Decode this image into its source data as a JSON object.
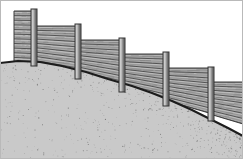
{
  "figure": {
    "width": 243,
    "height": 159,
    "background_color": "#ffffff",
    "border": {
      "present": true,
      "color": "#b9b9b9",
      "width": 1
    }
  },
  "colors": {
    "panel_fill": "#a8a8a8",
    "panel_fill_light": "#c2c2c2",
    "panel_grain_dark": "#4a4a4a",
    "panel_grain_mid": "#7d7d7d",
    "panel_outline": "#3c3c3c",
    "post_fill": "#b5b5b5",
    "post_shadow": "#6a6a6a",
    "post_outline": "#333333",
    "ground_fill": "#c9c9c9",
    "ground_speckle": "#555555",
    "ground_edge": "#1c1c1c",
    "sky": "#ffffff"
  },
  "ground": {
    "label": "sloping-ground",
    "description": "Speckled stippled soil bank descending from upper-left to lower-right",
    "edge_points": "0,63 18,61 40,62 62,66 86,72 108,79 132,86 152,93 172,101 192,110 210,119 228,128 243,136",
    "bottom": 159,
    "speckle_count": 1500
  },
  "fence": {
    "label": "stepped-wood-fence",
    "section_count": 6,
    "post_count": 5,
    "posts": [
      {
        "id": 1,
        "x": 31,
        "y_top": 9,
        "y_bottom": 66,
        "width": 6
      },
      {
        "id": 2,
        "x": 75,
        "y_top": 24,
        "y_bottom": 79,
        "width": 6
      },
      {
        "id": 3,
        "x": 119,
        "y_top": 38,
        "y_bottom": 92,
        "width": 6
      },
      {
        "id": 4,
        "x": 163,
        "y_top": 52,
        "y_bottom": 106,
        "width": 6
      },
      {
        "id": 5,
        "x": 208,
        "y_top": 67,
        "y_bottom": 121,
        "width": 6
      }
    ],
    "panels": [
      {
        "id": 1,
        "x": 14,
        "y_top": 11,
        "x2": 32,
        "y_bottom_left": 62,
        "y_bottom_right": 63,
        "plank_count": 11
      },
      {
        "id": 2,
        "x": 36,
        "y_top": 26,
        "x2": 76,
        "y_bottom_left": 65,
        "y_bottom_right": 73,
        "plank_count": 9
      },
      {
        "id": 3,
        "x": 80,
        "y_top": 40,
        "x2": 120,
        "y_bottom_left": 75,
        "y_bottom_right": 86,
        "plank_count": 9
      },
      {
        "id": 4,
        "x": 124,
        "y_top": 54,
        "x2": 164,
        "y_bottom_left": 88,
        "y_bottom_right": 99,
        "plank_count": 9
      },
      {
        "id": 5,
        "x": 168,
        "y_top": 68,
        "x2": 209,
        "y_bottom_left": 101,
        "y_bottom_right": 113,
        "plank_count": 9
      },
      {
        "id": 6,
        "x": 213,
        "y_top": 82,
        "x2": 243,
        "y_bottom_left": 115,
        "y_bottom_right": 124,
        "plank_count": 8
      }
    ]
  }
}
